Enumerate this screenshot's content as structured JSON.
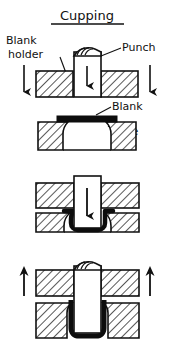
{
  "diagram": {
    "title": "Cupping",
    "title_underlined": true,
    "type": "sheet-metal-forming-process-sequence",
    "colors": {
      "background": "#ffffff",
      "ink": "#111111",
      "blank_fill": "#0d0d0d",
      "tool_fill": "#ffffff"
    },
    "labels": [
      {
        "id": "blank-holder",
        "text_line_1": "Blank",
        "text_line_2": "holder",
        "target": "upper-left-tool"
      },
      {
        "id": "punch",
        "text": "Punch",
        "target": "center-punch"
      },
      {
        "id": "blank",
        "text": "Blank",
        "target": "sheet-metal-stock"
      },
      {
        "id": "die",
        "text": "Die",
        "target": "lower-tool"
      }
    ],
    "panels": [
      {
        "index": 1,
        "name": "panel-1-blank-holder-and-punch",
        "caption": "Blank holder descends, punch positioned above blank",
        "arrows": [
          {
            "name": "arrow-left-down",
            "direction": "down"
          },
          {
            "name": "arrow-punch-down",
            "direction": "down"
          },
          {
            "name": "arrow-right-down",
            "direction": "down"
          }
        ],
        "parts": [
          "blank-holder-left",
          "blank-holder-right",
          "punch"
        ]
      },
      {
        "index": 2,
        "name": "panel-2-die-and-blank",
        "caption": "Flat blank resting on the die",
        "arrows": [],
        "parts": [
          "die-left",
          "die-right",
          "blank"
        ]
      },
      {
        "index": 3,
        "name": "panel-3-drawing",
        "caption": "Punch draws the blank into the die cavity",
        "arrows": [
          {
            "name": "arrow-punch-down",
            "direction": "down"
          }
        ],
        "parts": [
          "blank-holder-left",
          "blank-holder-right",
          "die-left",
          "die-right",
          "punch",
          "blank-drawn"
        ]
      },
      {
        "index": 4,
        "name": "panel-4-formed-cup",
        "caption": "Formed cup on punch, tooling retracts",
        "arrows": [
          {
            "name": "arrow-left-up",
            "direction": "up"
          },
          {
            "name": "arrow-right-up",
            "direction": "up"
          }
        ],
        "parts": [
          "blank-holder-left",
          "blank-holder-right",
          "die-left",
          "die-right",
          "punch",
          "cup"
        ]
      }
    ]
  }
}
